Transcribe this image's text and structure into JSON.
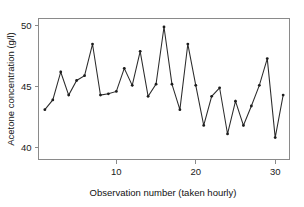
{
  "chart_data": {
    "type": "line",
    "title": "",
    "subtitle": "",
    "xlabel": "Observation number (taken hourly)",
    "ylabel": "Acetone concentration (g/l)",
    "xlim": [
      0.2,
      31.8
    ],
    "ylim": [
      39.0,
      50.6
    ],
    "xticks": [
      10,
      20,
      30
    ],
    "yticks": [
      40,
      45,
      50
    ],
    "xtick_labels": [
      "10",
      "20",
      "30"
    ],
    "ytick_labels": [
      "40",
      "45",
      "50"
    ],
    "grid": false,
    "legend": null,
    "marker": "filled-circle",
    "line_color": "#2b2b2b",
    "marker_color": "#1d1d1d",
    "axis_color": "#8a8a8a",
    "background_color": "#ffffff",
    "x": [
      1,
      2,
      3,
      4,
      5,
      6,
      7,
      8,
      9,
      10,
      11,
      12,
      13,
      14,
      15,
      16,
      17,
      18,
      19,
      20,
      21,
      22,
      23,
      24,
      25,
      26,
      27,
      28,
      29,
      30,
      31
    ],
    "values": [
      43.1,
      43.9,
      46.2,
      44.3,
      45.5,
      45.9,
      48.5,
      44.3,
      44.4,
      44.6,
      46.5,
      45.1,
      47.9,
      44.2,
      45.2,
      49.9,
      45.2,
      43.1,
      48.5,
      45.1,
      41.8,
      44.2,
      44.9,
      41.1,
      43.8,
      41.8,
      43.4,
      45.1,
      47.3,
      40.8,
      44.3
    ],
    "series": [
      {
        "name": "Acetone concentration",
        "values": [
          43.1,
          43.9,
          46.2,
          44.3,
          45.5,
          45.9,
          48.5,
          44.3,
          44.4,
          44.6,
          46.5,
          45.1,
          47.9,
          44.2,
          45.2,
          49.9,
          45.2,
          43.1,
          48.5,
          45.1,
          41.8,
          44.2,
          44.9,
          41.1,
          43.8,
          41.8,
          43.4,
          45.1,
          47.3,
          40.8,
          44.3
        ]
      }
    ],
    "n_points": 31,
    "y_units": "g/l",
    "x_units": "hours"
  },
  "figure": {
    "caption": ""
  }
}
